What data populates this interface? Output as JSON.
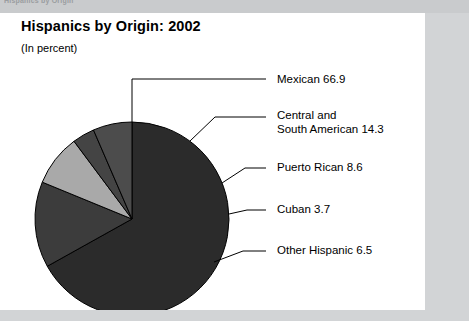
{
  "scan": {
    "top_fragment_text": "Hispanics  by  Origin"
  },
  "chart_data": {
    "type": "pie",
    "title": "Hispanics by Origin:  2002",
    "subtitle": "(In percent)",
    "xlabel": "",
    "ylabel": "",
    "units": "percent",
    "start_angle_deg": 0,
    "direction": "clockwise",
    "categories": [
      "Mexican",
      "Central and South American",
      "Puerto Rican",
      "Cuban",
      "Other Hispanic"
    ],
    "values": [
      66.9,
      14.3,
      8.6,
      3.7,
      6.5
    ],
    "colors": [
      "#2b2b2b",
      "#3c3c3c",
      "#a9a9a9",
      "#444444",
      "#4c4c4c"
    ],
    "legend_position": "right",
    "grid": false,
    "slices": [
      {
        "label": "Mexican",
        "value": 66.9,
        "value_text": "66.9",
        "label_text": "Mexican  66.9",
        "label_lines": [
          "Mexican  66.9"
        ],
        "color": "#2b2b2b",
        "label_x": 277,
        "label_y": 60,
        "leader_line": {
          "x1": 132,
          "y1": 109,
          "x2": 132,
          "y2": 66,
          "x3": 266,
          "y3": 66
        }
      },
      {
        "label": "Central and South American",
        "value": 14.3,
        "value_text": "14.3",
        "label_text": "Central and South American  14.3",
        "label_lines": [
          "Central and",
          "South American  14.3"
        ],
        "color": "#3c3c3c",
        "label_x": 277,
        "label_y": 96,
        "leader_line": {
          "x1": 190,
          "y1": 128,
          "x2": 215,
          "y2": 104,
          "x3": 266,
          "y3": 104
        }
      },
      {
        "label": "Puerto Rican",
        "value": 8.6,
        "value_text": "8.6",
        "label_text": "Puerto Rican  8.6",
        "label_lines": [
          "Puerto Rican  8.6"
        ],
        "color": "#a9a9a9",
        "label_x": 277,
        "label_y": 148,
        "leader_line": {
          "x1": 222,
          "y1": 170,
          "x2": 245,
          "y2": 155,
          "x3": 266,
          "y3": 155
        }
      },
      {
        "label": "Cuban",
        "value": 3.7,
        "value_text": "3.7",
        "label_text": "Cuban  3.7",
        "label_lines": [
          "Cuban  3.7"
        ],
        "color": "#444444",
        "label_x": 277,
        "label_y": 190,
        "leader_line": {
          "x1": 229,
          "y1": 201,
          "x2": 247,
          "y2": 197,
          "x3": 266,
          "y3": 197
        }
      },
      {
        "label": "Other Hispanic",
        "value": 6.5,
        "value_text": "6.5",
        "label_text": "Other Hispanic 6.5",
        "label_lines": [
          "Other Hispanic 6.5"
        ],
        "color": "#4c4c4c",
        "label_x": 277,
        "label_y": 231,
        "leader_line": {
          "x1": 214,
          "y1": 249,
          "x2": 243,
          "y2": 238,
          "x3": 266,
          "y3": 238
        }
      }
    ],
    "geometry": {
      "center_x": 132,
      "center_y": 206,
      "radius": 97
    }
  }
}
